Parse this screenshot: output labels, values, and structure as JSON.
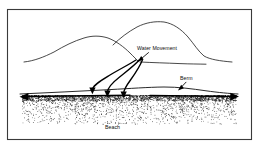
{
  "figure": {
    "kind": "beach-dune-cross-section-diagram",
    "background_color": "#ffffff",
    "ink_color": "#000000",
    "frame": {
      "name": "diagram-border",
      "stroke_color": "#3a3a3a",
      "x": 7,
      "y": 9,
      "width": 245,
      "height": 131
    }
  },
  "labels": {
    "water_movement": "Water Movement",
    "berm": "Berm",
    "beach": "Beach"
  },
  "label_positions": {
    "water_movement": {
      "x": 137,
      "y": 50
    },
    "berm": {
      "x": 180,
      "y": 80
    },
    "beach": {
      "x": 105,
      "y": 129
    }
  },
  "chart_data": {
    "type": "line",
    "xlabel": "",
    "ylabel": "",
    "xlim": [
      0,
      259
    ],
    "ylim": [
      148,
      0
    ],
    "grid": false,
    "legend": "none",
    "annotations": [
      {
        "text": "Water Movement",
        "x": 137,
        "y": 50,
        "pointer_from": [
          148,
          53
        ],
        "pointer_to": [
          137,
          61
        ],
        "arrowhead": "solid-triangle"
      },
      {
        "text": "Berm",
        "x": 180,
        "y": 80,
        "pointer_from": [
          186,
          82
        ],
        "pointer_to": [
          179,
          90
        ],
        "arrowhead": "solid-triangle"
      },
      {
        "text": "Beach",
        "x": 105,
        "y": 129,
        "pointer_from": null,
        "pointer_to": null,
        "arrowhead": "none"
      }
    ],
    "series": [
      {
        "name": "left-dune-ridge",
        "type": "outline",
        "points": [
          [
            24,
            62
          ],
          [
            32,
            60
          ],
          [
            42,
            57
          ],
          [
            52,
            53
          ],
          [
            62,
            48
          ],
          [
            72,
            43
          ],
          [
            82,
            39
          ],
          [
            92,
            36
          ],
          [
            100,
            36
          ],
          [
            108,
            38
          ],
          [
            116,
            42
          ],
          [
            124,
            48
          ],
          [
            130,
            53
          ],
          [
            135,
            58
          ],
          [
            138,
            61
          ]
        ]
      },
      {
        "name": "right-dune-ridge",
        "type": "outline",
        "points": [
          [
            113,
            45
          ],
          [
            120,
            39
          ],
          [
            128,
            33
          ],
          [
            136,
            28
          ],
          [
            145,
            24
          ],
          [
            154,
            22
          ],
          [
            163,
            22
          ],
          [
            172,
            25
          ],
          [
            180,
            30
          ],
          [
            187,
            37
          ],
          [
            193,
            44
          ],
          [
            198,
            51
          ],
          [
            204,
            56
          ],
          [
            212,
            59
          ],
          [
            222,
            61
          ],
          [
            232,
            62
          ]
        ]
      },
      {
        "name": "dune-base-line",
        "type": "outline",
        "points": [
          [
            140,
            62
          ],
          [
            152,
            63
          ],
          [
            166,
            63
          ],
          [
            180,
            64
          ],
          [
            194,
            64
          ],
          [
            206,
            64
          ]
        ]
      },
      {
        "name": "beach-surface-line",
        "type": "outline",
        "points": [
          [
            20,
            94
          ],
          [
            40,
            93
          ],
          [
            60,
            92
          ],
          [
            80,
            91
          ],
          [
            100,
            90
          ],
          [
            120,
            89
          ],
          [
            140,
            88
          ],
          [
            158,
            87
          ],
          [
            172,
            87
          ],
          [
            186,
            88
          ],
          [
            200,
            90
          ],
          [
            214,
            92
          ],
          [
            228,
            93
          ],
          [
            238,
            94
          ]
        ]
      },
      {
        "name": "water-flow-path-1",
        "type": "flow-arrow",
        "points": [
          [
            136,
            61
          ],
          [
            130,
            64
          ],
          [
            122,
            68
          ],
          [
            112,
            73
          ],
          [
            102,
            78
          ],
          [
            95,
            84
          ],
          [
            92,
            90
          ]
        ],
        "arrow_at_end": true
      },
      {
        "name": "water-flow-path-2",
        "type": "flow-arrow",
        "points": [
          [
            139,
            61
          ],
          [
            134,
            65
          ],
          [
            127,
            70
          ],
          [
            119,
            76
          ],
          [
            112,
            82
          ],
          [
            108,
            88
          ],
          [
            107,
            93
          ]
        ],
        "arrow_at_end": true
      },
      {
        "name": "water-flow-path-3",
        "type": "flow-arrow",
        "points": [
          [
            142,
            61
          ],
          [
            139,
            66
          ],
          [
            134,
            72
          ],
          [
            129,
            79
          ],
          [
            125,
            85
          ],
          [
            123,
            90
          ],
          [
            123,
            94
          ]
        ],
        "arrow_at_end": true
      },
      {
        "name": "longshore-arrow-left",
        "type": "double-arrow-segment",
        "from": [
          24,
          97
        ],
        "to": [
          128,
          95
        ],
        "arrow_at_start": true
      },
      {
        "name": "longshore-arrow-right",
        "type": "double-arrow-segment",
        "from": [
          150,
          95
        ],
        "to": [
          236,
          96
        ],
        "arrow_at_end": true
      }
    ],
    "sand_fill": {
      "name": "beach-sand-stipple",
      "description": "dense stipple dots below beach surface fading downward",
      "top_y": 95,
      "bottom_y": 124,
      "left_x": 22,
      "right_x": 236,
      "dot_color": "#1c1c1c"
    }
  }
}
